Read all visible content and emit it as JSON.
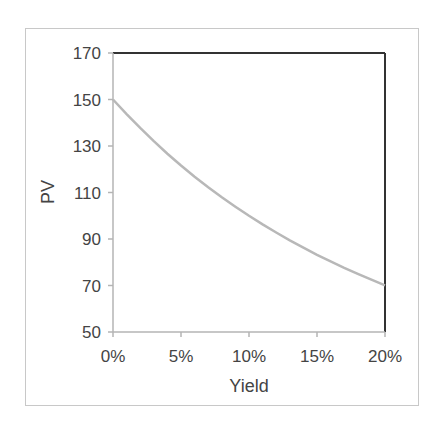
{
  "chart_data": {
    "type": "line",
    "title": "",
    "xlabel": "Yield",
    "ylabel": "PV",
    "x": [
      0,
      0.01,
      0.02,
      0.03,
      0.04,
      0.05,
      0.06,
      0.07,
      0.08,
      0.09,
      0.1,
      0.11,
      0.12,
      0.13,
      0.14,
      0.15,
      0.16,
      0.17,
      0.18,
      0.19,
      0.2
    ],
    "series": [
      {
        "name": "PV",
        "color": "#b8b8b8",
        "values": [
          150.0,
          143.7,
          137.8,
          132.1,
          126.7,
          121.6,
          116.8,
          112.3,
          108.0,
          103.9,
          100.0,
          96.3,
          92.8,
          89.4,
          86.3,
          83.2,
          80.4,
          77.6,
          75.0,
          72.5,
          70.1
        ]
      }
    ],
    "xlim": [
      0,
      0.2
    ],
    "ylim": [
      50,
      170
    ],
    "x_ticks": [
      "0%",
      "5%",
      "10%",
      "15%",
      "20%"
    ],
    "y_ticks": [
      "50",
      "70",
      "90",
      "110",
      "130",
      "150",
      "170"
    ],
    "grid": false,
    "legend": null
  }
}
